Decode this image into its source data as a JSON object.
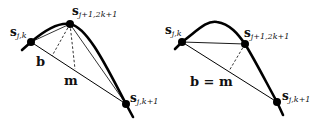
{
  "left_panel": {
    "points": {
      "start": {
        "label": "s",
        "sub": "j,k"
      },
      "mid": {
        "label": "s",
        "sub": "j+1,2k+1"
      },
      "end": {
        "label": "s",
        "sub": "j,k+1"
      }
    },
    "labels": {
      "b": "b",
      "m": "m"
    }
  },
  "right_panel": {
    "points": {
      "start": {
        "label": "s",
        "sub": "j,k"
      },
      "mid": {
        "label": "s",
        "sub": "j+1,2k+1"
      },
      "end": {
        "label": "s",
        "sub": "j,k+1"
      }
    },
    "labels": {
      "bm": "b = m"
    }
  },
  "colors": {
    "stroke": "#000000",
    "background": "#ffffff"
  }
}
